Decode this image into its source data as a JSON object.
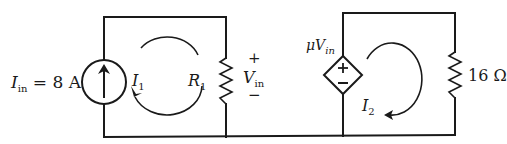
{
  "diagram": {
    "type": "circuit",
    "colors": {
      "ink": "#1a1a1a",
      "background": "#ffffff"
    },
    "left_loop": {
      "source": {
        "kind": "independent-current-source",
        "label_var": "I",
        "label_sub": "in",
        "label_eq": " = 8 A",
        "value": "8 A",
        "arrow_direction": "up"
      },
      "mesh_current": {
        "var": "I",
        "sub": "1",
        "direction": "counterclockwise"
      },
      "resistor": {
        "var": "R",
        "sub": "1"
      },
      "voltage": {
        "plus": "+",
        "var": "V",
        "sub": "in",
        "minus": "−"
      }
    },
    "right_loop": {
      "source": {
        "kind": "dependent-voltage-source",
        "label_mu": "μ",
        "label_var": "V",
        "label_sub": "in",
        "plus": "+",
        "minus": "−"
      },
      "mesh_current": {
        "var": "I",
        "sub": "2",
        "direction": "clockwise"
      },
      "resistor": {
        "value": "16 Ω"
      }
    }
  }
}
